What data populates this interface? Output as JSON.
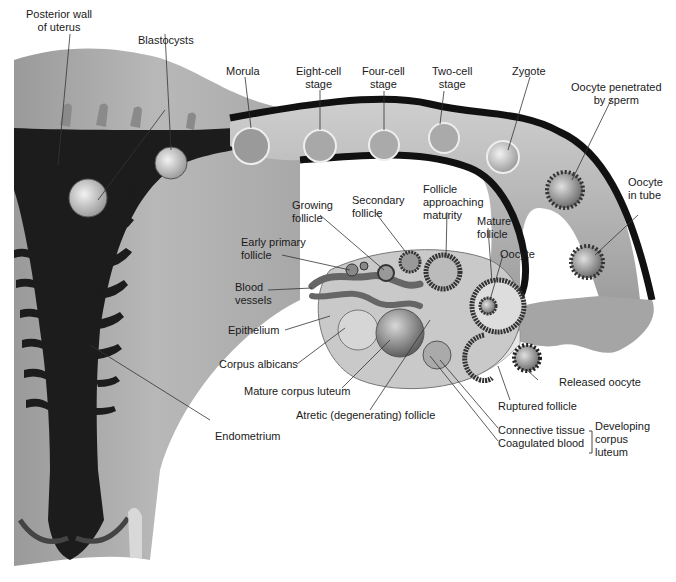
{
  "diagram": {
    "type": "anatomical illustration",
    "labels": {
      "posterior_wall": "Posterior wall\nof uterus",
      "blastocysts": "Blastocysts",
      "morula": "Morula",
      "eight_cell": "Eight-cell\nstage",
      "four_cell": "Four-cell\nstage",
      "two_cell": "Two-cell\nstage",
      "zygote": "Zygote",
      "oocyte_penetrated": "Oocyte penetrated\nby sperm",
      "oocyte_in_tube": "Oocyte\nin tube",
      "growing_follicle": "Growing\nfollicle",
      "secondary_follicle": "Secondary\nfollicle",
      "follicle_approaching": "Follicle\napproaching\nmaturity",
      "mature_follicle": "Mature\nfollicle",
      "oocyte": "Oocyte",
      "early_primary": "Early primary\nfollicle",
      "blood_vessels": "Blood\nvessels",
      "epithelium": "Epithelium",
      "corpus_albicans": "Corpus albicans",
      "mature_corpus_luteum": "Mature corpus luteum",
      "atretic_follicle": "Atretic (degenerating) follicle",
      "released_oocyte": "Released oocyte",
      "ruptured_follicle": "Ruptured follicle",
      "connective_tissue": "Connective tissue",
      "coagulated_blood": "Coagulated blood",
      "developing_corpus_luteum": "Developing\ncorpus\nluteum",
      "endometrium": "Endometrium"
    },
    "colors": {
      "tissue_light": "#b5b5b5",
      "tissue_mid": "#8a8a8a",
      "lumen_dark": "#1c1c1c",
      "tube_wall": "#111111",
      "ovary_fill": "#c9c9c9",
      "leader_line": "#333333"
    }
  }
}
